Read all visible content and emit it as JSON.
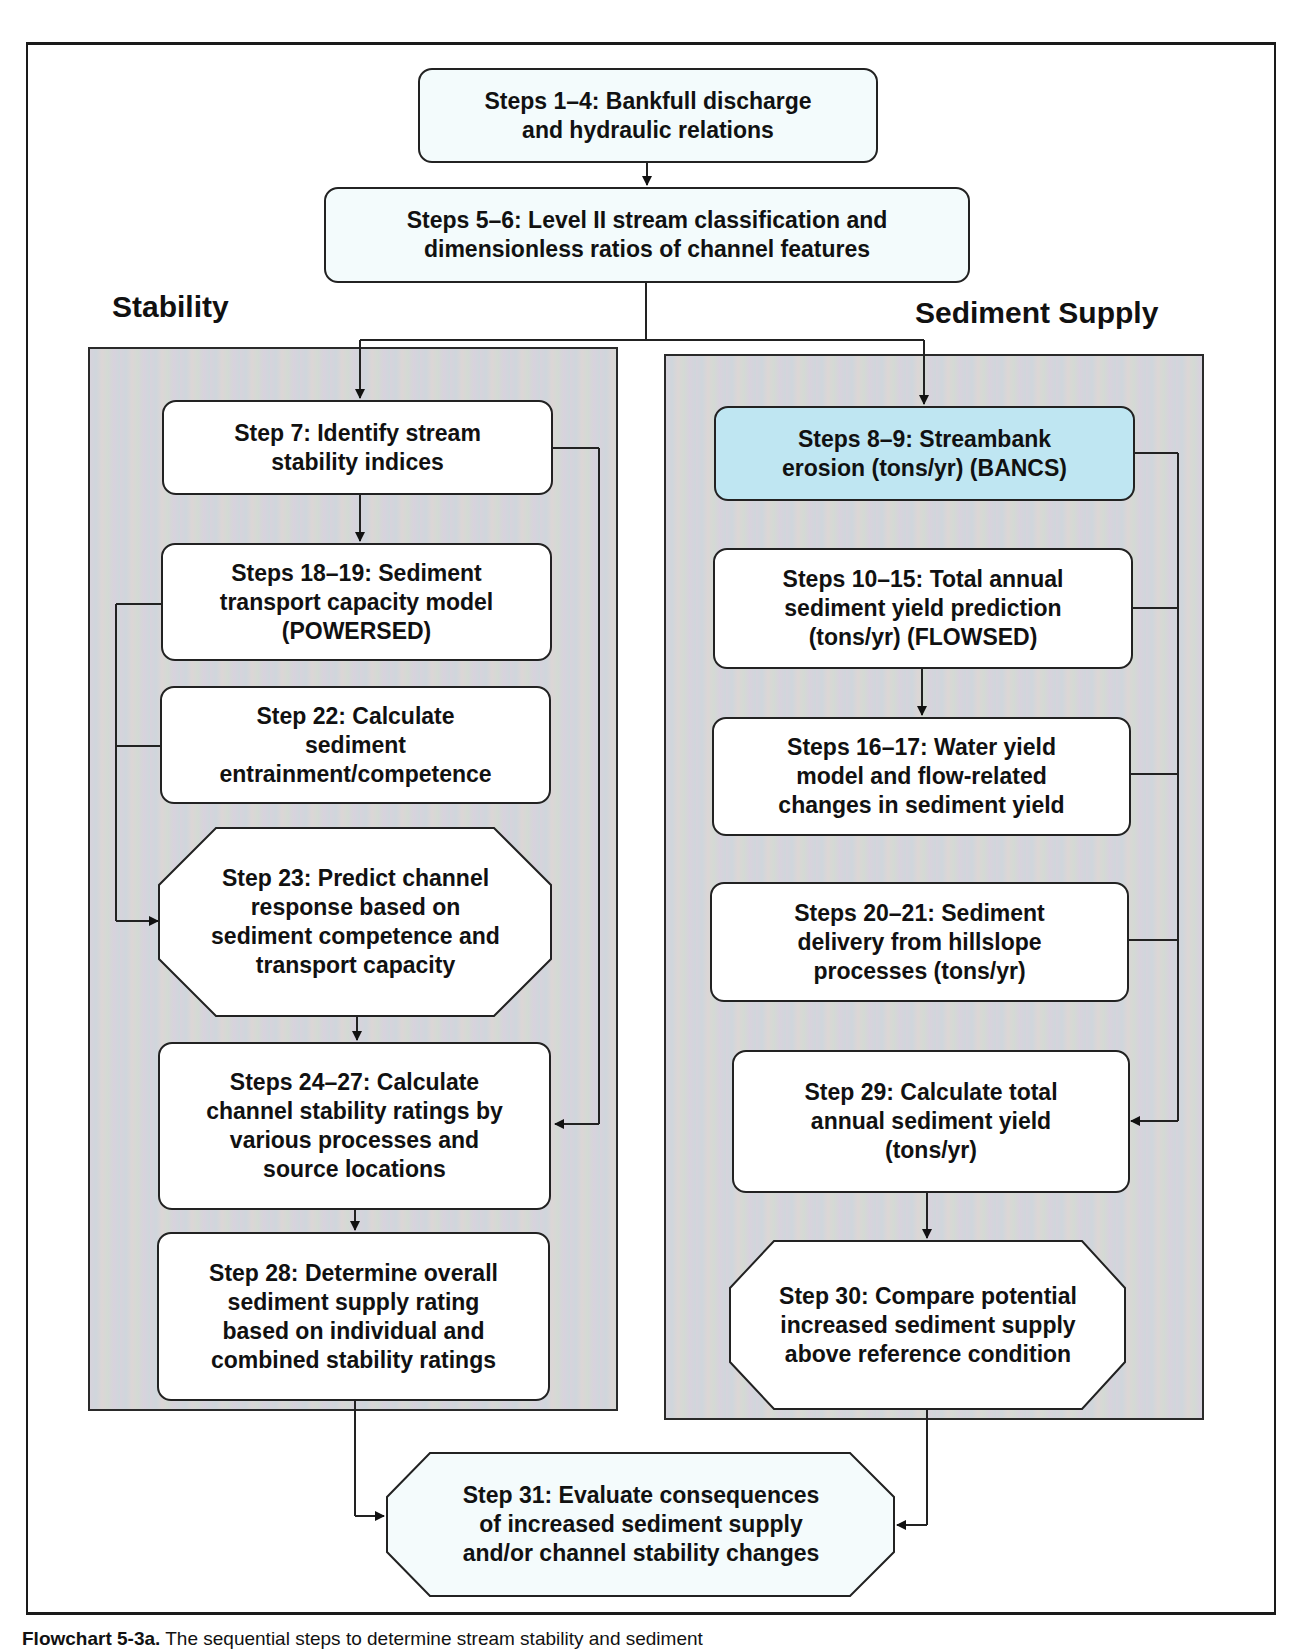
{
  "sections": {
    "stability_title": "Stability",
    "sediment_supply_title": "Sediment Supply"
  },
  "steps": {
    "s1_4": "Steps 1–4:  Bankfull discharge\nand hydraulic relations",
    "s5_6": "Steps 5–6:  Level II stream classification and\ndimensionless ratios of channel features",
    "s7": "Step 7:  Identify stream\nstability indices",
    "s18_19": "Steps 18–19:  Sediment\ntransport capacity model\n(POWERSED)",
    "s22": "Step 22:  Calculate\nsediment\nentrainment/competence",
    "s23": "Step 23:  Predict channel\nresponse based on\nsediment competence and\ntransport capacity",
    "s24_27": "Steps 24–27:  Calculate\nchannel stability ratings by\nvarious processes and\nsource locations",
    "s28": "Step 28:  Determine overall\nsediment supply rating\nbased on individual and\ncombined stability ratings",
    "s8_9": "Steps 8–9:  Streambank\nerosion (tons/yr) (BANCS)",
    "s10_15": "Steps 10–15:  Total annual\nsediment yield prediction\n(tons/yr) (FLOWSED)",
    "s16_17": "Steps 16–17:  Water yield\nmodel and flow-related\nchanges in sediment yield",
    "s20_21": "Steps 20–21:  Sediment\ndelivery from hillslope\nprocesses (tons/yr)",
    "s29": "Step 29:  Calculate total\nannual sediment yield\n(tons/yr)",
    "s30": "Step 30:  Compare potential\nincreased sediment supply\nabove reference condition",
    "s31": "Step 31:  Evaluate consequences\nof increased sediment supply\nand/or channel stability changes"
  },
  "caption": {
    "label": "Flowchart 5-3a.",
    "text": "The sequential steps to determine stream stability and sediment"
  },
  "colors": {
    "highlight_box": "#bfe6f2",
    "panel_bg": "#d6d6dc",
    "line": "#222222"
  }
}
